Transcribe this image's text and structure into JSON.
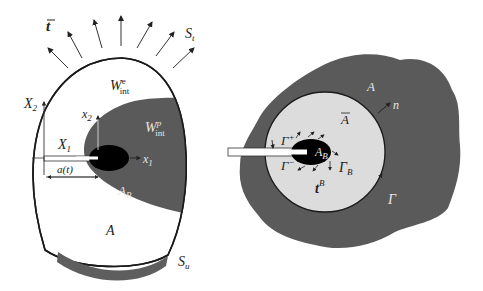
{
  "figure": {
    "left_panel": {
      "traction_label": "t",
      "traction_boundary_label": "S",
      "traction_boundary_sub": "t",
      "elastic_energy_label": "W",
      "elastic_energy_sub": "int",
      "elastic_energy_sup": "e",
      "plastic_energy_label": "W",
      "plastic_energy_sub": "int",
      "plastic_energy_sup": "p",
      "global_axis_x": "X",
      "global_axis_x_sub": "1",
      "global_axis_y": "X",
      "global_axis_y_sub": "2",
      "local_axis_x": "x",
      "local_axis_x_sub": "1",
      "local_axis_y": "x",
      "local_axis_y_sub": "2",
      "crack_length_label": "a(t)",
      "process_zone_label": "A",
      "process_zone_sub": "B",
      "body_label": "A",
      "displacement_boundary_label": "S",
      "displacement_boundary_sub": "u"
    },
    "right_panel": {
      "outer_region_label": "A",
      "normal_label": "n",
      "inner_region_label": "A",
      "crack_upper_face_label": "Γ",
      "crack_upper_face_sup": "+",
      "crack_lower_face_label": "Γ",
      "crack_lower_face_sup": "−",
      "process_zone_label": "A",
      "process_zone_sub": "B",
      "process_zone_boundary_label": "Γ",
      "process_zone_boundary_sub": "B",
      "traction_label": "t",
      "traction_sup": "B",
      "contour_label": "Γ"
    },
    "colors": {
      "dark_region": "#5a5a5a",
      "light_region": "#dcdcdc",
      "process_zone": "#000000",
      "outline": "#1a1a1a"
    }
  }
}
